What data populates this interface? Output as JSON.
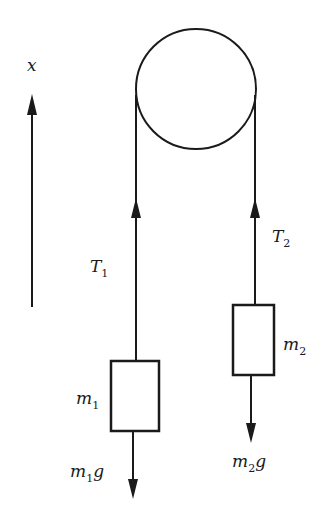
{
  "diagram": {
    "axis": {
      "label": "x",
      "direction": "up"
    },
    "pulley": {
      "label": ""
    },
    "tension_left": {
      "symbol": "T",
      "subscript": "1"
    },
    "tension_right": {
      "symbol": "T",
      "subscript": "2"
    },
    "mass_left": {
      "symbol": "m",
      "subscript": "1"
    },
    "mass_right": {
      "symbol": "m",
      "subscript": "2"
    },
    "weight_left": {
      "symbol": "m",
      "subscript": "1",
      "suffix": "g"
    },
    "weight_right": {
      "symbol": "m",
      "subscript": "2",
      "suffix": "g"
    },
    "colors": {
      "ink": "#1a1a1a",
      "background": "#ffffff"
    }
  }
}
